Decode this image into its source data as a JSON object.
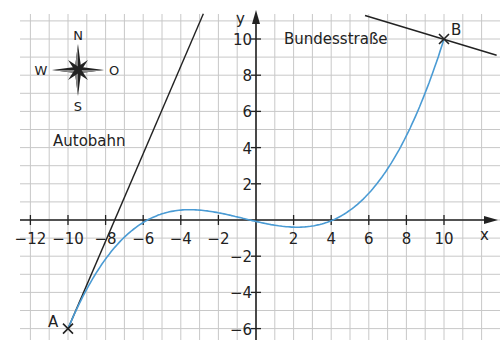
{
  "chart_data": {
    "type": "line",
    "title": "",
    "xlabel": "x",
    "ylabel": "y",
    "xlim": [
      -13,
      12
    ],
    "ylim": [
      -6.5,
      11.5
    ],
    "grid": true,
    "x_ticks": [
      -12,
      -10,
      -8,
      -6,
      -4,
      -2,
      2,
      4,
      6,
      8,
      10
    ],
    "x_tick_labels": [
      "−12",
      "−10",
      "−8",
      "−6",
      "−4",
      "−2",
      "2",
      "4",
      "6",
      "8",
      "10"
    ],
    "y_ticks": [
      -6,
      -4,
      -2,
      2,
      4,
      6,
      8,
      10
    ],
    "y_tick_labels": [
      "−6",
      "−4",
      "−2",
      "2",
      "4",
      "6",
      "8",
      "10"
    ],
    "series": [
      {
        "name": "Verbindungsstraße (Kurve)",
        "color": "#4a9bd4",
        "function": "f(x) ≈ 0.0104·x·(x+6)·(x−4)",
        "x": [
          -10,
          -8,
          -6,
          -4,
          -3.5,
          -2,
          0,
          2,
          4,
          6,
          8,
          10
        ],
        "y": [
          -6,
          -2.0,
          0,
          0.33,
          0.34,
          0.25,
          0,
          -0.17,
          0,
          1.5,
          4.5,
          10
        ]
      },
      {
        "name": "Autobahn",
        "color": "#222222",
        "x": [
          -10,
          -7.7,
          -2.8
        ],
        "y": [
          -6,
          0,
          11.4
        ]
      },
      {
        "name": "Bundesstraße",
        "color": "#222222",
        "x": [
          5.8,
          10,
          12.8
        ],
        "y": [
          11.3,
          10,
          9.1
        ]
      }
    ],
    "points": [
      {
        "label": "A",
        "x": -10,
        "y": -6
      },
      {
        "label": "B",
        "x": 10,
        "y": 10
      }
    ],
    "annotations": [
      "Autobahn",
      "Bundesstraße"
    ],
    "compass": {
      "N": "N",
      "S": "S",
      "W": "W",
      "O": "O"
    }
  },
  "labels": {
    "autobahn": "Autobahn",
    "bundesstrasse": "Bundesstraße",
    "point_a": "A",
    "point_b": "B",
    "x_axis": "x",
    "y_axis": "y",
    "compass_n": "N",
    "compass_s": "S",
    "compass_w": "W",
    "compass_o": "O"
  },
  "colors": {
    "curve": "#4a9bd4",
    "axis": "#222222",
    "grid": "#c8c8c8"
  }
}
